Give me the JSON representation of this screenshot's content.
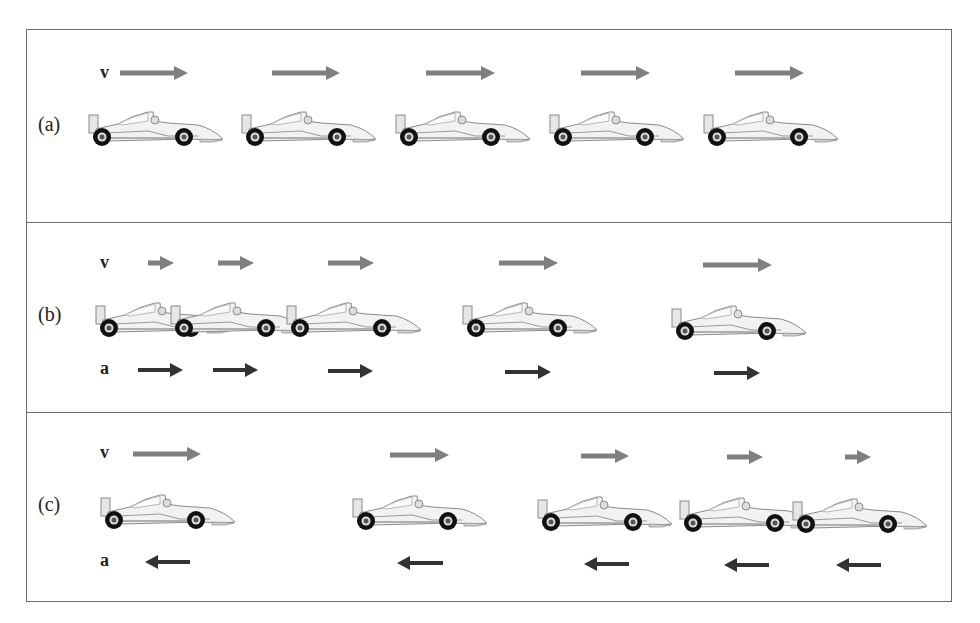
{
  "figure": {
    "colors": {
      "frame": "#6a6a6a",
      "velocity_arrow": "#7f7f7f",
      "acceleration_arrow": "#333333",
      "car_body": "#f2f2f2",
      "car_outline": "#8a8a8a",
      "wheel": "#111111"
    },
    "labels": {
      "velocity": "v",
      "acceleration": "a"
    },
    "panels": [
      {
        "id": "a",
        "label": "(a)",
        "description": "constant velocity, zero acceleration",
        "label_pos": [
          38,
          113
        ],
        "v_label_pos": [
          100,
          62
        ],
        "a_label_pos": null,
        "velocity_arrows": [
          {
            "x1": 120,
            "x2": 188,
            "y": 73
          },
          {
            "x1": 272,
            "x2": 340,
            "y": 73
          },
          {
            "x1": 426,
            "x2": 495,
            "y": 73
          },
          {
            "x1": 581,
            "x2": 650,
            "y": 73
          },
          {
            "x1": 735,
            "x2": 804,
            "y": 73
          }
        ],
        "cars": [
          {
            "x": 88,
            "y": 109
          },
          {
            "x": 241,
            "y": 109
          },
          {
            "x": 395,
            "y": 109
          },
          {
            "x": 549,
            "y": 109
          },
          {
            "x": 703,
            "y": 109
          }
        ],
        "acceleration_arrows": []
      },
      {
        "id": "b",
        "label": "(b)",
        "description": "speeding up, acceleration parallel to velocity",
        "label_pos": [
          38,
          303
        ],
        "v_label_pos": [
          100,
          252
        ],
        "a_label_pos": [
          100,
          358
        ],
        "velocity_arrows": [
          {
            "x1": 148,
            "x2": 174,
            "y": 263
          },
          {
            "x1": 218,
            "x2": 254,
            "y": 263
          },
          {
            "x1": 328,
            "x2": 374,
            "y": 263
          },
          {
            "x1": 499,
            "x2": 558,
            "y": 263
          },
          {
            "x1": 703,
            "x2": 772,
            "y": 265
          }
        ],
        "cars": [
          {
            "x": 95,
            "y": 300
          },
          {
            "x": 170,
            "y": 300
          },
          {
            "x": 286,
            "y": 300
          },
          {
            "x": 462,
            "y": 300
          },
          {
            "x": 671,
            "y": 303
          }
        ],
        "acceleration_arrows": [
          {
            "x1": 138,
            "x2": 183,
            "y": 370,
            "dir": "right"
          },
          {
            "x1": 213,
            "x2": 258,
            "y": 370,
            "dir": "right"
          },
          {
            "x1": 328,
            "x2": 373,
            "y": 371,
            "dir": "right"
          },
          {
            "x1": 505,
            "x2": 551,
            "y": 372,
            "dir": "right"
          },
          {
            "x1": 714,
            "x2": 760,
            "y": 373,
            "dir": "right"
          }
        ]
      },
      {
        "id": "c",
        "label": "(c)",
        "description": "slowing down, acceleration opposite to velocity",
        "label_pos": [
          38,
          493
        ],
        "v_label_pos": [
          100,
          442
        ],
        "a_label_pos": [
          100,
          550
        ],
        "velocity_arrows": [
          {
            "x1": 133,
            "x2": 201,
            "y": 454
          },
          {
            "x1": 390,
            "x2": 449,
            "y": 455
          },
          {
            "x1": 581,
            "x2": 629,
            "y": 456
          },
          {
            "x1": 727,
            "x2": 763,
            "y": 457
          },
          {
            "x1": 845,
            "x2": 871,
            "y": 457
          }
        ],
        "cars": [
          {
            "x": 100,
            "y": 492
          },
          {
            "x": 352,
            "y": 493
          },
          {
            "x": 537,
            "y": 494
          },
          {
            "x": 679,
            "y": 495
          },
          {
            "x": 792,
            "y": 496
          }
        ],
        "acceleration_arrows": [
          {
            "x1": 145,
            "x2": 190,
            "y": 562,
            "dir": "left"
          },
          {
            "x1": 397,
            "x2": 443,
            "y": 563,
            "dir": "left"
          },
          {
            "x1": 584,
            "x2": 629,
            "y": 564,
            "dir": "left"
          },
          {
            "x1": 724,
            "x2": 769,
            "y": 565,
            "dir": "left"
          },
          {
            "x1": 836,
            "x2": 881,
            "y": 565,
            "dir": "left"
          }
        ]
      }
    ]
  }
}
